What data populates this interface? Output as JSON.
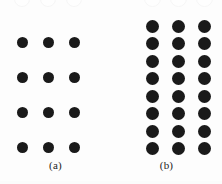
{
  "figure": {
    "background_color": "#fdfdfd",
    "dot_color": "#1a1a1a",
    "label_color": "#232323",
    "ghost_circle_color": "#f6f6f6",
    "caption_a": "(a)",
    "caption_b": "(b)"
  },
  "chart_data": {
    "type": "scatter",
    "title": "",
    "subtitle": "",
    "xlabel": "",
    "ylabel": "",
    "grid": false,
    "legend_position": "none",
    "annotations": [
      "(a)",
      "(b)"
    ],
    "panels": [
      {
        "id": "a",
        "label": "(a)",
        "rows": 4,
        "columns": 3,
        "dot_count": 12,
        "dot_diameter_px": 11,
        "column_spacing_px": 26,
        "row_spacing_px": 35,
        "spacing_description": "sparse - wide vertical gaps between rows",
        "origin_x_px": 22,
        "origin_y_px": 42,
        "marker_color": "#1a1a1a",
        "marker_shape": "circle",
        "points": [
          {
            "x": 0,
            "y": 0
          },
          {
            "x": 1,
            "y": 0
          },
          {
            "x": 2,
            "y": 0
          },
          {
            "x": 0,
            "y": 1
          },
          {
            "x": 1,
            "y": 1
          },
          {
            "x": 2,
            "y": 1
          },
          {
            "x": 0,
            "y": 2
          },
          {
            "x": 1,
            "y": 2
          },
          {
            "x": 2,
            "y": 2
          },
          {
            "x": 0,
            "y": 3
          },
          {
            "x": 1,
            "y": 3
          },
          {
            "x": 2,
            "y": 3
          }
        ],
        "ghost_row": {
          "count": 3,
          "diameter_px": 16,
          "spacing_px": 26,
          "visible_fraction": 0.45
        }
      },
      {
        "id": "b",
        "label": "(b)",
        "rows": 8,
        "columns": 3,
        "dot_count": 24,
        "dot_diameter_px": 13,
        "column_spacing_px": 26,
        "row_spacing_px": 17.5,
        "spacing_description": "dense - tight vertical packing of rows",
        "origin_x_px": 152,
        "origin_y_px": 26,
        "marker_color": "#1a1a1a",
        "marker_shape": "circle",
        "points": [
          {
            "x": 0,
            "y": 0
          },
          {
            "x": 1,
            "y": 0
          },
          {
            "x": 2,
            "y": 0
          },
          {
            "x": 0,
            "y": 1
          },
          {
            "x": 1,
            "y": 1
          },
          {
            "x": 2,
            "y": 1
          },
          {
            "x": 0,
            "y": 2
          },
          {
            "x": 1,
            "y": 2
          },
          {
            "x": 2,
            "y": 2
          },
          {
            "x": 0,
            "y": 3
          },
          {
            "x": 1,
            "y": 3
          },
          {
            "x": 2,
            "y": 3
          },
          {
            "x": 0,
            "y": 4
          },
          {
            "x": 1,
            "y": 4
          },
          {
            "x": 2,
            "y": 4
          },
          {
            "x": 0,
            "y": 5
          },
          {
            "x": 1,
            "y": 5
          },
          {
            "x": 2,
            "y": 5
          },
          {
            "x": 0,
            "y": 6
          },
          {
            "x": 1,
            "y": 6
          },
          {
            "x": 2,
            "y": 6
          },
          {
            "x": 0,
            "y": 7
          },
          {
            "x": 1,
            "y": 7
          },
          {
            "x": 2,
            "y": 7
          }
        ],
        "ghost_row": {
          "count": 3,
          "diameter_px": 17,
          "spacing_px": 26,
          "visible_fraction": 0.4
        }
      }
    ]
  }
}
